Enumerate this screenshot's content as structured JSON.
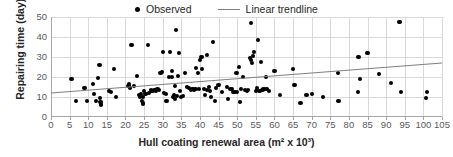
{
  "chart_data": {
    "type": "scatter",
    "title": "",
    "xlabel": "Hull coating renewal area (m² x 10³)",
    "ylabel": "Repairing time (day)",
    "xlim": [
      0,
      105
    ],
    "ylim": [
      0,
      50
    ],
    "xticks": [
      0,
      5,
      10,
      15,
      20,
      25,
      30,
      35,
      40,
      45,
      50,
      55,
      60,
      65,
      70,
      75,
      80,
      85,
      90,
      95,
      100,
      105
    ],
    "yticks": [
      0,
      10,
      20,
      30,
      40,
      50
    ],
    "grid": true,
    "legend_position": "top-center",
    "legend": [
      {
        "label": "Observed",
        "marker": "dot",
        "color": "#000000"
      },
      {
        "label": "Linear trendline",
        "marker": "line",
        "color": "#7f7f7f"
      }
    ],
    "series": [
      {
        "name": "Observed",
        "marker": "dot",
        "color": "#000000",
        "points": [
          [
            5.5,
            18.9
          ],
          [
            6.8,
            7.8
          ],
          [
            9.0,
            14.6
          ],
          [
            9.6,
            8.0
          ],
          [
            11.2,
            16.3
          ],
          [
            11.6,
            11.3
          ],
          [
            12.0,
            8.0
          ],
          [
            12.6,
            19.5
          ],
          [
            13.0,
            25.8
          ],
          [
            13.1,
            9.4
          ],
          [
            13.3,
            7.5
          ],
          [
            13.4,
            6.3
          ],
          [
            13.5,
            5.8
          ],
          [
            15.6,
            13.0
          ],
          [
            16.2,
            12.4
          ],
          [
            17.0,
            23.8
          ],
          [
            17.4,
            10.0
          ],
          [
            20.8,
            15.4
          ],
          [
            21.0,
            16.3
          ],
          [
            21.2,
            14.3
          ],
          [
            21.6,
            35.9
          ],
          [
            22.2,
            15.6
          ],
          [
            23.0,
            20.6
          ],
          [
            23.6,
            11.0
          ],
          [
            24.0,
            9.9
          ],
          [
            24.2,
            11.6
          ],
          [
            24.4,
            8.2
          ],
          [
            24.6,
            7.0
          ],
          [
            24.7,
            6.4
          ],
          [
            24.8,
            10.0
          ],
          [
            25.0,
            12.8
          ],
          [
            25.4,
            11.5
          ],
          [
            26.0,
            36.0
          ],
          [
            26.4,
            12.2
          ],
          [
            26.8,
            13.5
          ],
          [
            27.0,
            13.2
          ],
          [
            27.4,
            13.0
          ],
          [
            27.8,
            13.6
          ],
          [
            28.2,
            13.2
          ],
          [
            28.6,
            13.8
          ],
          [
            29.0,
            13.4
          ],
          [
            29.4,
            21.8
          ],
          [
            29.8,
            22.6
          ],
          [
            30.0,
            32.4
          ],
          [
            30.4,
            12.0
          ],
          [
            30.8,
            11.5
          ],
          [
            31.0,
            8.0
          ],
          [
            31.6,
            20.0
          ],
          [
            32.0,
            32.3
          ],
          [
            32.4,
            22.8
          ],
          [
            32.6,
            19.8
          ],
          [
            32.8,
            10.0
          ],
          [
            33.0,
            11.0
          ],
          [
            33.2,
            15.4
          ],
          [
            33.4,
            9.2
          ],
          [
            33.6,
            43.6
          ],
          [
            33.8,
            10.6
          ],
          [
            34.0,
            20.3
          ],
          [
            34.4,
            32.2
          ],
          [
            34.6,
            13.0
          ],
          [
            35.0,
            10.0
          ],
          [
            35.4,
            10.6
          ],
          [
            36.0,
            22.0
          ],
          [
            36.6,
            15.0
          ],
          [
            37.0,
            14.4
          ],
          [
            37.6,
            13.4
          ],
          [
            38.0,
            14.0
          ],
          [
            38.4,
            13.6
          ],
          [
            38.8,
            14.2
          ],
          [
            39.0,
            24.5
          ],
          [
            39.4,
            22.0
          ],
          [
            39.8,
            14.0
          ],
          [
            40.0,
            28.4
          ],
          [
            40.4,
            30.0
          ],
          [
            40.6,
            24.0
          ],
          [
            41.0,
            13.8
          ],
          [
            41.4,
            11.0
          ],
          [
            41.8,
            31.0
          ],
          [
            42.0,
            13.4
          ],
          [
            42.4,
            15.0
          ],
          [
            42.6,
            13.0
          ],
          [
            43.0,
            9.8
          ],
          [
            43.6,
            37.4
          ],
          [
            44.0,
            8.0
          ],
          [
            44.4,
            14.6
          ],
          [
            45.0,
            15.8
          ],
          [
            46.0,
            12.4
          ],
          [
            47.2,
            15.0
          ],
          [
            47.6,
            9.0
          ],
          [
            48.2,
            14.2
          ],
          [
            48.6,
            14.0
          ],
          [
            49.0,
            12.4
          ],
          [
            49.4,
            12.6
          ],
          [
            49.8,
            22.0
          ],
          [
            50.0,
            12.6
          ],
          [
            50.4,
            25.0
          ],
          [
            50.8,
            7.6
          ],
          [
            51.0,
            14.0
          ],
          [
            51.6,
            20.0
          ],
          [
            52.0,
            13.4
          ],
          [
            52.6,
            13.2
          ],
          [
            53.0,
            13.4
          ],
          [
            53.4,
            29.6
          ],
          [
            53.6,
            46.9
          ],
          [
            53.8,
            28.4
          ],
          [
            54.0,
            26.8
          ],
          [
            54.2,
            30.4
          ],
          [
            54.6,
            32.4
          ],
          [
            55.0,
            13.0
          ],
          [
            55.4,
            14.4
          ],
          [
            55.6,
            38.4
          ],
          [
            56.0,
            13.2
          ],
          [
            56.4,
            27.6
          ],
          [
            56.8,
            13.4
          ],
          [
            57.0,
            14.0
          ],
          [
            57.4,
            13.8
          ],
          [
            57.8,
            20.0
          ],
          [
            58.0,
            14.2
          ],
          [
            58.6,
            13.0
          ],
          [
            60.0,
            23.0
          ],
          [
            61.4,
            11.2
          ],
          [
            65.0,
            24.0
          ],
          [
            65.4,
            16.2
          ],
          [
            67.0,
            7.2
          ],
          [
            68.6,
            11.0
          ],
          [
            70.0,
            11.4
          ],
          [
            73.0,
            10.0
          ],
          [
            77.0,
            22.0
          ],
          [
            77.2,
            8.0
          ],
          [
            82.4,
            12.6
          ],
          [
            82.6,
            29.8
          ],
          [
            83.0,
            19.0
          ],
          [
            85.0,
            31.8
          ],
          [
            88.0,
            21.6
          ],
          [
            91.2,
            16.8
          ],
          [
            93.6,
            47.6
          ],
          [
            94.0,
            12.6
          ],
          [
            100.6,
            9.4
          ],
          [
            101.0,
            12.6
          ]
        ]
      }
    ],
    "trendline": {
      "name": "Linear trendline",
      "color": "#7f7f7f",
      "x_start": 0,
      "y_start": 12.0,
      "x_end": 105,
      "y_end": 27.0
    }
  }
}
